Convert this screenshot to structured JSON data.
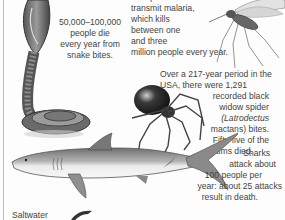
{
  "page": {
    "type": "scanned-book-page",
    "background": "#fdfdfd",
    "ink": "#444444"
  },
  "captions": {
    "snake": {
      "lines": [
        "50,000–100,000",
        "people die",
        "every year from",
        "snake bites."
      ]
    },
    "mosquito": {
      "lines": [
        "Mosquitoes",
        "transmit malaria,",
        "which kills",
        "between one",
        "and three",
        "million people every year."
      ]
    },
    "spider": {
      "lines": [
        "Over a 217-year period in the",
        "USA, there were 1,291",
        "recorded black",
        "widow spider",
        "(Latrodectus",
        "mactans) bites.",
        "Fifty-five of the",
        "victims died."
      ]
    },
    "shark": {
      "lines": [
        "Sharks",
        "attack about",
        "100 people per",
        "year: about 25 attacks",
        "result in death."
      ]
    },
    "crocodile": {
      "lines": [
        "Saltwater"
      ]
    }
  },
  "illustrations": [
    {
      "name": "cobra",
      "position": "top-left"
    },
    {
      "name": "mosquito",
      "position": "top-right"
    },
    {
      "name": "black-widow-spider",
      "position": "middle-right"
    },
    {
      "name": "shark",
      "position": "middle-left"
    },
    {
      "name": "crocodile-partial",
      "position": "bottom-center"
    }
  ]
}
